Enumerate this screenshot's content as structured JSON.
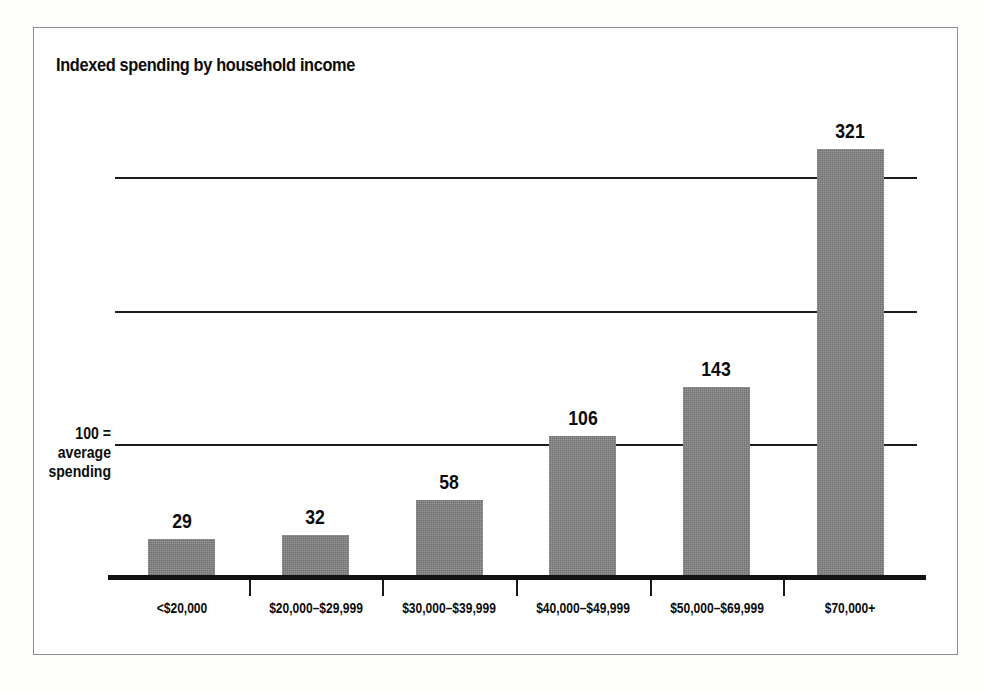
{
  "figure": {
    "title": "Indexed spending by household income",
    "axis_note_lines": [
      "100 =",
      "average",
      "spending"
    ],
    "frame_color": "#8d8d8d",
    "bar_color": "#7d7d7d",
    "text_color": "#0c0c0c",
    "axis_color": "#121212"
  },
  "chart_data": {
    "type": "bar",
    "title": "Indexed spending by household income",
    "xlabel": "",
    "ylabel": "100 = average spending",
    "categories": [
      "<$20,000",
      "$20,000–$29,999",
      "$30,000–$39,999",
      "$40,000–$49,999",
      "$50,000–$69,999",
      "$70,000+"
    ],
    "values": [
      29,
      32,
      58,
      106,
      143,
      321
    ],
    "value_labels": [
      "29",
      "32",
      "58",
      "106",
      "143",
      "321"
    ],
    "ylim": [
      0,
      350
    ],
    "gridlines": [
      100,
      200,
      300
    ],
    "grid": true,
    "legend": "none",
    "annotations": [
      "100 = average spending"
    ]
  }
}
